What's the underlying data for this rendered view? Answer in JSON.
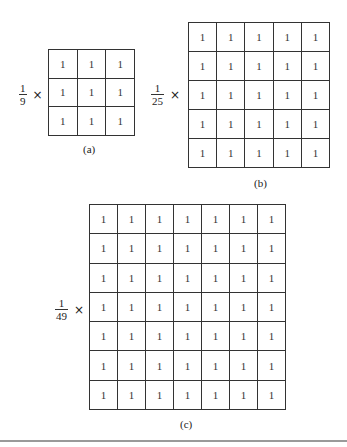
{
  "figures": [
    {
      "id": "a",
      "caption": "(a)",
      "size": 3,
      "factor": {
        "numerator": "1",
        "denominator": "9",
        "operator": "×"
      },
      "cell_value": "1"
    },
    {
      "id": "b",
      "caption": "(b)",
      "size": 5,
      "factor": {
        "numerator": "1",
        "denominator": "25",
        "operator": "×"
      },
      "cell_value": "1"
    },
    {
      "id": "c",
      "caption": "(c)",
      "size": 7,
      "factor": {
        "numerator": "1",
        "denominator": "49",
        "operator": "×"
      },
      "cell_value": "1"
    }
  ]
}
